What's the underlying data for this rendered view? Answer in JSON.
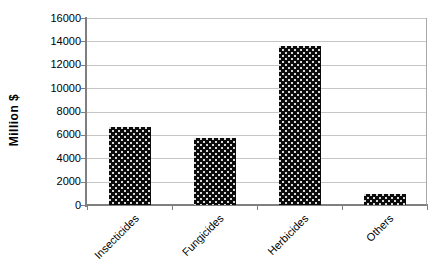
{
  "chart_data": {
    "type": "bar",
    "title": "",
    "xlabel": "",
    "ylabel": "Million $",
    "categories": [
      "Insecticides",
      "Fungicides",
      "Herbicides",
      "Others"
    ],
    "values": [
      6700,
      5700,
      13600,
      950
    ],
    "ylim": [
      0,
      16000
    ],
    "yticks": [
      0,
      2000,
      4000,
      6000,
      8000,
      10000,
      12000,
      14000,
      16000
    ],
    "ytick_step": 2000,
    "grid": true,
    "legend": false,
    "x_tick_label_rotation": -45,
    "bar_fill": "black-with-light-dot-pattern",
    "colors": {
      "background": "#ffffff",
      "bar": "#0b0b0b",
      "bar_dots": "#dcdcdc",
      "axis": "#7f7f7f",
      "gridline": "#c6c6c6",
      "plot_border": "#a8a8a8",
      "text": "#000000"
    }
  }
}
